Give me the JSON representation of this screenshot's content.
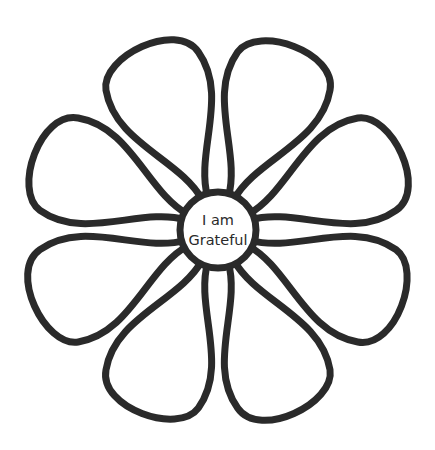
{
  "center": {
    "line1": "I am",
    "line2": "Grateful"
  },
  "petals": {
    "count": 8
  },
  "colors": {
    "stroke": "#2a2a2a",
    "fill": "#ffffff",
    "background": "#ffffff"
  }
}
